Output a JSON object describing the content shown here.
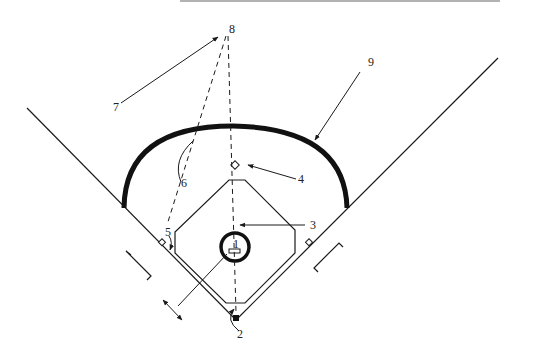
{
  "diagram": {
    "colors": {
      "line": "#1a1a1a",
      "background": "#ffffff",
      "top_edge": "#888888"
    },
    "labels": [
      {
        "id": "1",
        "text": "1",
        "x": 237,
        "y": 248
      },
      {
        "id": "2",
        "text": "2",
        "x": 240,
        "y": 337
      },
      {
        "id": "3",
        "text": "3",
        "x": 313,
        "y": 229
      },
      {
        "id": "4",
        "text": "4",
        "x": 301,
        "y": 182
      },
      {
        "id": "5",
        "text": "5",
        "x": 168,
        "y": 235
      },
      {
        "id": "6",
        "text": "6",
        "x": 184,
        "y": 186
      },
      {
        "id": "7",
        "text": "7",
        "x": 116,
        "y": 111
      },
      {
        "id": "8",
        "text": "8",
        "x": 232,
        "y": 33
      },
      {
        "id": "9",
        "text": "9",
        "x": 371,
        "y": 66
      }
    ]
  }
}
